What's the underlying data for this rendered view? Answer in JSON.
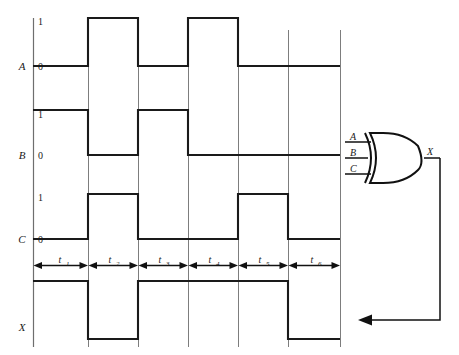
{
  "diagram": {
    "signals": [
      {
        "name": "A",
        "label": "A",
        "high_label": "1",
        "low_label": "0",
        "values": [
          0,
          1,
          0,
          1,
          0,
          0
        ]
      },
      {
        "name": "B",
        "label": "B",
        "high_label": "1",
        "low_label": "0",
        "values": [
          1,
          0,
          1,
          0,
          0,
          0
        ]
      },
      {
        "name": "C",
        "label": "C",
        "high_label": "1",
        "low_label": "0",
        "values": [
          0,
          1,
          0,
          0,
          1,
          0
        ]
      },
      {
        "name": "X",
        "label": "X",
        "high_label": "",
        "low_label": "",
        "values": [
          1,
          0,
          1,
          1,
          1,
          0
        ]
      }
    ],
    "intervals": [
      {
        "label": "t",
        "sub": "1"
      },
      {
        "label": "t",
        "sub": "2"
      },
      {
        "label": "t",
        "sub": "3"
      },
      {
        "label": "t",
        "sub": "4"
      },
      {
        "label": "t",
        "sub": "5"
      },
      {
        "label": "t",
        "sub": "6"
      }
    ],
    "gate": {
      "type": "xor-gate",
      "inputs": [
        "A",
        "B",
        "C"
      ],
      "output": "X"
    },
    "colors": {
      "waveform": "#1a1a1a",
      "grid": "#6e6e6e",
      "background": "#ffffff"
    }
  }
}
